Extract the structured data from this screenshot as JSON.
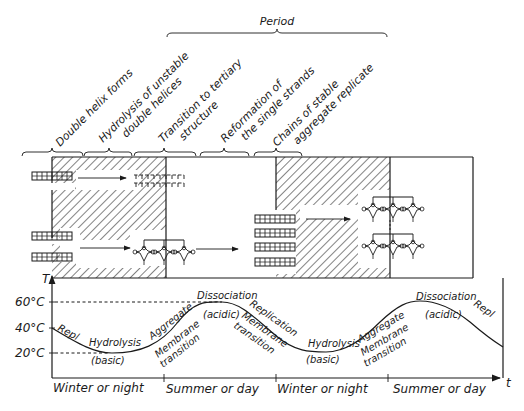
{
  "figure": {
    "period_label": "Period",
    "phase_labels": [
      {
        "lines": [
          "Double helix forms"
        ]
      },
      {
        "lines": [
          "Hydrolysis of unstable",
          "double helices"
        ]
      },
      {
        "lines": [
          "Transition to tertiary",
          "structure"
        ]
      },
      {
        "lines": [
          "Reformation of",
          "the single strands"
        ]
      },
      {
        "lines": [
          "Chains of stable",
          "aggregate replicate"
        ]
      }
    ],
    "graph": {
      "y_axis_label": "T",
      "x_axis_label": "t",
      "y_ticks": [
        "60°C",
        "40°C",
        "20°C"
      ],
      "x_segments": [
        "Winter or night",
        "Summer or day",
        "Winter or night",
        "Summer or day"
      ],
      "curve_annotations": {
        "repl_1": "Repl",
        "hydrolysis_1": "Hydrolysis",
        "basic_1": "(basic)",
        "aggregate_1": "Aggregate",
        "membrane_1a": "Membrane",
        "membrane_1b": "transition",
        "dissociation_1": "Dissociation",
        "acidic_1": "(acidic)",
        "replication_1": "Replication",
        "membrane_2a": "Membrane",
        "membrane_2b": "transition",
        "hydrolysis_2": "Hydrolysis",
        "basic_2": "(basic)",
        "aggregate_2": "Aggregate",
        "membrane_3a": "Membrane",
        "membrane_3b": "transition",
        "dissociation_2": "Dissociation",
        "acidic_2": "(acidic)",
        "repl_2": "Repl"
      }
    },
    "colors": {
      "ink": "#1a1a1a",
      "background": "#ffffff"
    }
  }
}
